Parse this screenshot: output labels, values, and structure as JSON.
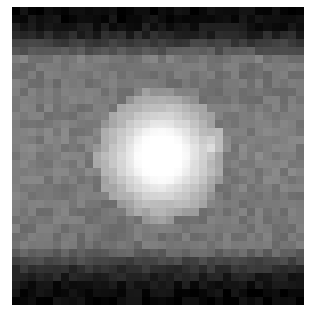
{
  "image": {
    "description": "Grayscale pixelated image of a bright point-like source at center on a gray diffuse background, dark bands at top and bottom",
    "grid": {
      "cols": 36,
      "rows": 37
    },
    "background_gray": 128,
    "dark_band_gray": 8,
    "top_dark_fraction": 0.18,
    "bottom_dark_fraction": 0.2,
    "source": {
      "cx_frac": 0.51,
      "cy_frac": 0.5,
      "radius_frac": 0.14,
      "peak_gray": 255
    },
    "secondary_patch": {
      "cx_frac": 0.71,
      "cy_frac": 0.45,
      "radius_frac": 0.04,
      "boost": 25
    },
    "colors": {
      "frame_border": "#d0d0d0",
      "page_background": "#ffffff"
    }
  }
}
